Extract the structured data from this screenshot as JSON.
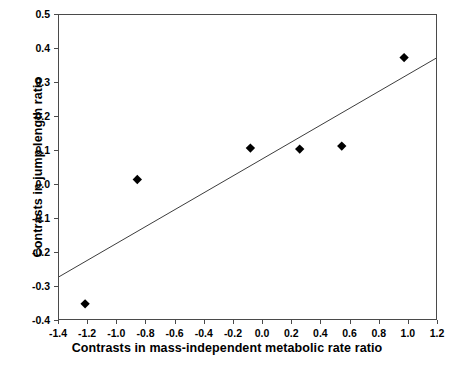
{
  "chart_data": {
    "type": "scatter",
    "title": "",
    "xlabel": "Contrasts in mass-independent metabolic rate ratio",
    "ylabel": "Contrasts in jump length ratio",
    "xlim": [
      -1.4,
      1.2
    ],
    "ylim": [
      -0.4,
      0.5
    ],
    "xticks": [
      -1.4,
      -1.2,
      -1.0,
      -0.8,
      -0.6,
      -0.4,
      -0.2,
      0.0,
      0.2,
      0.4,
      0.6,
      0.8,
      1.0,
      1.2
    ],
    "yticks": [
      -0.4,
      -0.3,
      -0.2,
      -0.1,
      0.0,
      0.1,
      0.2,
      0.3,
      0.4,
      0.5
    ],
    "xtick_labels": [
      "-1.4",
      "-1.2",
      "-1.0",
      "-0.8",
      "-0.6",
      "-0.4",
      "-0.2",
      "0.0",
      "0.2",
      "0.4",
      "0.6",
      "0.8",
      "1.0",
      "1.2"
    ],
    "ytick_labels": [
      "-0.4",
      "-0.3",
      "-0.2",
      "-0.1",
      "0.0",
      "0.1",
      "0.2",
      "0.3",
      "0.4",
      "0.5"
    ],
    "grid": false,
    "legend": false,
    "marker": "diamond",
    "marker_color": "#000000",
    "marker_size": 7,
    "points": [
      {
        "x": -1.22,
        "y": -0.355
      },
      {
        "x": -0.86,
        "y": 0.013
      },
      {
        "x": -0.08,
        "y": 0.106
      },
      {
        "x": 0.26,
        "y": 0.103
      },
      {
        "x": 0.55,
        "y": 0.112
      },
      {
        "x": 0.98,
        "y": 0.374
      }
    ],
    "trendline": {
      "type": "linear",
      "color": "#3a3a3a",
      "x_start": -1.4,
      "y_start": -0.275,
      "x_end": 1.2,
      "y_end": 0.372
    }
  },
  "colors": {
    "background": "#ffffff",
    "axis": "#4a4a4a",
    "text": "#000000",
    "marker": "#000000",
    "trendline": "#3a3a3a"
  }
}
